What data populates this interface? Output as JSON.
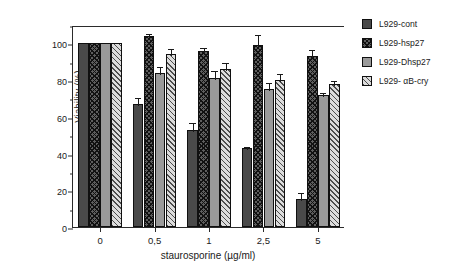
{
  "chart_data": {
    "type": "bar",
    "title": "",
    "xlabel": "staurosporine (µg/ml)",
    "ylabel": "Viability (%)",
    "categories": [
      "0",
      "0,5",
      "1",
      "2,5",
      "5"
    ],
    "ylim": [
      0,
      110
    ],
    "yticks": [
      0,
      20,
      40,
      60,
      80,
      100
    ],
    "ytick_labels": [
      "0",
      "20",
      "40",
      "60",
      "80",
      "100"
    ],
    "yminor_ticks": [
      10,
      30,
      50,
      70,
      90,
      110
    ],
    "grid": false,
    "legend_position": "right",
    "series": [
      {
        "name": "L929-cont",
        "color": "#4a4a4a",
        "pattern": "solid-dark",
        "values": [
          100,
          67,
          53,
          43,
          15
        ],
        "errors": [
          0,
          4.5,
          4.5,
          1.5,
          4.5
        ]
      },
      {
        "name": "L929-hsp27",
        "color": "#5e5e5e",
        "pattern": "crosshatch",
        "values": [
          100,
          104,
          96,
          99,
          93
        ],
        "errors": [
          0,
          2,
          2.5,
          6.5,
          4.5
        ]
      },
      {
        "name": "L929-Dhsp27",
        "color": "#9a9a9a",
        "pattern": "solid-gray",
        "values": [
          100,
          84,
          81,
          75,
          72
        ],
        "errors": [
          0,
          4,
          5,
          4.5,
          2
        ]
      },
      {
        "name": "L929- αB-cry",
        "color": "#dcdcdc",
        "pattern": "diagonal-hatch",
        "values": [
          100,
          94,
          86,
          80,
          78
        ],
        "errors": [
          0,
          4,
          4.5,
          4.5,
          2.5
        ]
      }
    ]
  }
}
